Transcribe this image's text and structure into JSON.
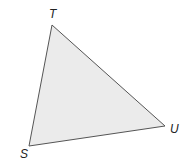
{
  "diagram": {
    "type": "triangle",
    "fill": "#ebebeb",
    "stroke": "#555555",
    "vertices": [
      {
        "label": "T",
        "x": 52,
        "y": 25,
        "label_x": 49,
        "label_y": 18
      },
      {
        "label": "U",
        "x": 165,
        "y": 126,
        "label_x": 170,
        "label_y": 133
      },
      {
        "label": "S",
        "x": 29,
        "y": 146,
        "label_x": 20,
        "label_y": 158
      }
    ]
  }
}
